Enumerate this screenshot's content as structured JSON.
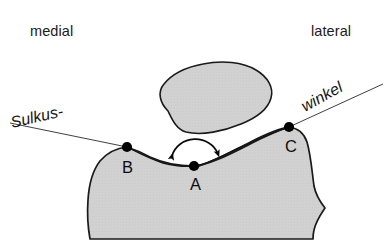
{
  "figure": {
    "background_color": "#ffffff"
  },
  "orientation_labels": [
    {
      "id": "medial",
      "text": "medial",
      "x": 30,
      "y": 36
    },
    {
      "id": "lateral",
      "text": "lateral",
      "x": 311,
      "y": 36
    }
  ],
  "callouts": [
    {
      "id": "sulkus",
      "text": "Sulkus-",
      "x": 12,
      "y": 128,
      "rotation": -13
    },
    {
      "id": "winkel",
      "text": "winkel",
      "x": 305,
      "y": 112,
      "rotation": -29
    }
  ],
  "points": [
    {
      "id": "A",
      "label": "A",
      "x": 194,
      "y": 166,
      "label_x": 190,
      "label_y": 190,
      "description": "sulcus deepest point"
    },
    {
      "id": "B",
      "label": "B",
      "x": 127,
      "y": 147,
      "label_x": 122,
      "label_y": 173,
      "description": "medial condyle summit"
    },
    {
      "id": "C",
      "label": "C",
      "x": 289,
      "y": 127,
      "label_x": 285,
      "label_y": 152,
      "description": "lateral condyle summit"
    }
  ],
  "colors": {
    "bone_fill": "#d2d2d2",
    "bone_stroke": "#1a1a1a",
    "marker": "#000000",
    "text": "#141414",
    "background": "#ffffff"
  },
  "shapes": {
    "patella": {
      "name": "patella",
      "fill": "#d2d2d2",
      "stroke_width": 1.6,
      "path": "M 168 111 C 160 103 157 92 164 84 C 172 74 187 67 203 64 C 222 60 243 62 256 70 C 268 77 274 88 271 98 C 268 109 256 118 241 124 C 224 131 202 136 186 132 C 176 129 172 119 168 111 Z"
    },
    "femur": {
      "name": "distal-femur-trochlea",
      "fill": "#d2d2d2",
      "stroke_width": 1.7,
      "path": "M 127 147 C 133 149 141 152 150 157 C 163 163 180 166 194 166 L 194 166 C 210 165 232 153 252 143 C 266 136 280 130 289 127 C 297 128 304 133 307 142 C 311 156 312 172 314 186 C 316 196 321 203 325 208 C 321 214 316 221 314 230 C 313 234 313 237 313 239 L 90 239 C 88 228 87 214 88 200 C 89 184 93 170 100 161 C 107 153 117 148 127 147 Z"
    },
    "trochlear_groove_line": {
      "name": "trochlear-cartilage-line",
      "path": "M 127 147 C 137 152 150 159 163 163 C 175 166 186 167 194 166 C 206 165 224 155 244 146 C 262 137 279 130 289 127",
      "stroke_width": 1.4
    },
    "cartilage_gap_line": {
      "name": "lateral-facet-double-line",
      "path": "M 196 167 C 210 163 230 152 250 142 C 266 134 281 128 289 127",
      "stroke_width": 1.3
    }
  },
  "leader_lines": [
    {
      "id": "sulkus-leader",
      "name": "sulkus-leader-line",
      "path": "M 10 123 L 127 147"
    },
    {
      "id": "winkel-leader",
      "name": "winkel-leader-line",
      "path": "M 383 84 L 289 127"
    }
  ],
  "angle_marker": {
    "name": "sulcus-angle-arc",
    "description": "double-headed arc arrow indicating the sulcus angle at point A",
    "arc_path": "M 172 156 A 24 22 0 0 1 218 154",
    "arrow_start": {
      "x": 172,
      "y": 156,
      "angle": 118
    },
    "arrow_end": {
      "x": 218,
      "y": 154,
      "angle": 62
    }
  }
}
